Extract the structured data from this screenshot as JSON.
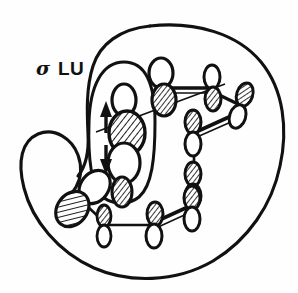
{
  "figure": {
    "background_color": "#ffffff",
    "ink_color": "#111111",
    "width": 298,
    "height": 293
  },
  "labels": {
    "sigma": "σ",
    "lu": "LU"
  },
  "envelopes": [
    {
      "name": "outer-lobe-envelope",
      "description": "large kidney / bean shaped outer orbital envelope enclosing the whole framework",
      "stroke_width": 3.0
    },
    {
      "name": "inner-sigma-envelope",
      "description": "narrow vertical oval enclosing the central sigma orbital pair",
      "stroke_width": 3.0
    }
  ],
  "electron_arrows": [
    {
      "name": "spin-up-arrow",
      "direction": "up",
      "x": 106,
      "y": 118
    },
    {
      "name": "spin-down-arrow",
      "direction": "down",
      "x": 106,
      "y": 155
    }
  ],
  "orbitals": [
    {
      "id": "central-upper",
      "shaded_lobe": "bottom",
      "tilt": 0,
      "cx": 124,
      "cy": 123,
      "rx": 16,
      "ry": 21,
      "kind": "large"
    },
    {
      "id": "central-lower",
      "shaded_lobe": "bottom",
      "tilt": 0,
      "cx": 124,
      "cy": 168,
      "rx": 14,
      "ry": 19,
      "kind": "large"
    },
    {
      "id": "top-center",
      "shaded_lobe": "bottom",
      "tilt": 0,
      "cx": 162,
      "cy": 85,
      "rx": 13,
      "ry": 17,
      "kind": "medium"
    },
    {
      "id": "top-right-a",
      "shaded_lobe": "bottom",
      "tilt": 0,
      "cx": 213,
      "cy": 85,
      "rx": 9,
      "ry": 14,
      "kind": "small"
    },
    {
      "id": "top-right-b",
      "shaded_lobe": "top",
      "tilt": 20,
      "cx": 240,
      "cy": 105,
      "rx": 9,
      "ry": 14,
      "kind": "small"
    },
    {
      "id": "mid-right-a",
      "shaded_lobe": "top",
      "tilt": 0,
      "cx": 194,
      "cy": 128,
      "rx": 9,
      "ry": 14,
      "kind": "small"
    },
    {
      "id": "mid-right-b",
      "shaded_lobe": "top",
      "tilt": 0,
      "cx": 194,
      "cy": 180,
      "rx": 9,
      "ry": 14,
      "kind": "small"
    },
    {
      "id": "bottom-left",
      "shaded_lobe": "bottom",
      "tilt": 40,
      "cx": 83,
      "cy": 197,
      "rx": 15,
      "ry": 20,
      "kind": "large"
    },
    {
      "id": "bottom-center-a",
      "shaded_lobe": "top",
      "tilt": 0,
      "cx": 104,
      "cy": 222,
      "rx": 8,
      "ry": 13,
      "kind": "small"
    },
    {
      "id": "bottom-center-b",
      "shaded_lobe": "top",
      "tilt": 0,
      "cx": 155,
      "cy": 222,
      "rx": 8,
      "ry": 13,
      "kind": "small"
    },
    {
      "id": "bottom-right",
      "shaded_lobe": "top",
      "tilt": 0,
      "cx": 192,
      "cy": 205,
      "rx": 8,
      "ry": 13,
      "kind": "small"
    }
  ],
  "bonds": [
    {
      "name": "bond-center-to-topcenter",
      "from": "central-upper",
      "to": "top-center",
      "style": "thin"
    },
    {
      "name": "bond-topcenter-to-topright-a",
      "from": "top-center",
      "to": "top-right-a",
      "style": "double"
    },
    {
      "name": "bond-toprighta-to-toprightb",
      "from": "top-right-a",
      "to": "top-right-b",
      "style": "double"
    },
    {
      "name": "bond-toprightb-to-midrighta",
      "from": "top-right-b",
      "to": "mid-right-a",
      "style": "double"
    },
    {
      "name": "bond-midrighta-to-midrightb",
      "from": "mid-right-a",
      "to": "mid-right-b",
      "style": "chain"
    },
    {
      "name": "bond-midrightb-to-bottomright",
      "from": "mid-right-b",
      "to": "bottom-right",
      "style": "thin"
    },
    {
      "name": "bond-bottomright-to-bottomcenterb",
      "from": "bottom-right",
      "to": "bottom-center-b",
      "style": "double"
    },
    {
      "name": "bond-bottomcenterb-to-bottomcentera",
      "from": "bottom-center-b",
      "to": "bottom-center-a",
      "style": "thin"
    },
    {
      "name": "bond-bottomcentera-to-bottomleft",
      "from": "bottom-center-a",
      "to": "bottom-left",
      "style": "thin"
    }
  ]
}
